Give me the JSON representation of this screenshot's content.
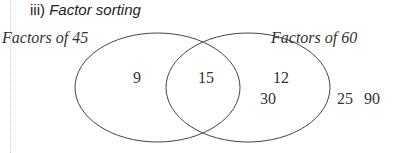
{
  "title": {
    "prefix": "iii)",
    "text": "Factor sorting"
  },
  "diagram": {
    "type": "venn",
    "sets": [
      {
        "label": "Factors of 45",
        "only": [
          "9"
        ]
      },
      {
        "label": "Factors of 60",
        "only": [
          "12",
          "30"
        ]
      }
    ],
    "intersection": [
      "15"
    ],
    "outside": [
      "25",
      "90"
    ],
    "labels": {
      "left_set": "Factors of 45",
      "right_set": "Factors of 60"
    },
    "numbers": {
      "left_only_0": "9",
      "both_0": "15",
      "right_only_0": "12",
      "right_only_1": "30",
      "outside_0": "25",
      "outside_1": "90"
    }
  }
}
